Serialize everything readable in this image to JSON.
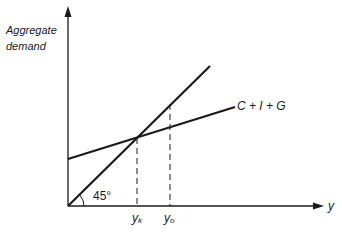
{
  "diagram": {
    "y_axis_label_line1": "Aggregate",
    "y_axis_label_line2": "demand",
    "x_axis_label": "y",
    "line_45_label": "45°",
    "aggregate_line_label": "C + I + G",
    "tick_yk": "y",
    "tick_yk_sub": "k",
    "tick_yo": "y",
    "tick_yo_sub": "o",
    "line_color": "#1a1a1a"
  }
}
